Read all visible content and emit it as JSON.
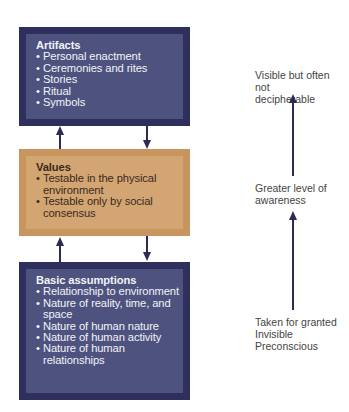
{
  "diagram": {
    "levels": [
      {
        "title": "Artifacts",
        "items": [
          "Personal enactment",
          "Ceremonies and rites",
          "Stories",
          "Ritual",
          "Symbols"
        ]
      },
      {
        "title": "Values",
        "items": [
          "Testable in the physical environment",
          "Testable only by social consensus"
        ]
      },
      {
        "title": "Basic assumptions",
        "items": [
          "Relationship to environment",
          "Nature of reality, time, and space",
          "Nature of human nature",
          "Nature of human activity",
          "Nature of human relationships"
        ]
      }
    ],
    "awareness_scale": {
      "top": "Visible but often not decipherable",
      "middle": "Greater level of awareness",
      "bottom": [
        "Taken for granted",
        "Invisible",
        "Preconscious"
      ]
    },
    "colors": {
      "dark_outer": "#2f2f5e",
      "dark_inner": "#4d527e",
      "tan_outer": "#c9955e",
      "tan_inner": "#d3a573",
      "arrow": "#2b2b55"
    }
  }
}
